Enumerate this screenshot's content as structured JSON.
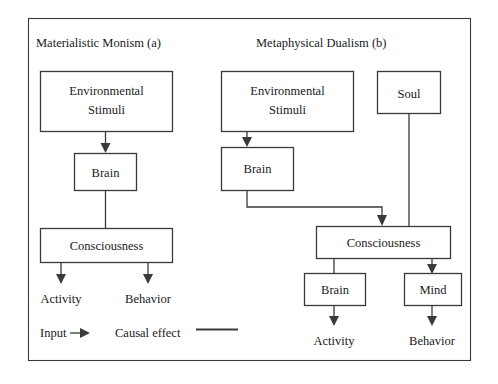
{
  "figure": {
    "panels": [
      {
        "id": "a",
        "title": "Materialistic Monism (a)",
        "nodes": [
          {
            "id": "a-env",
            "label": "Environmental\nStimuli",
            "line1": "Environmental",
            "line2": "Stimuli"
          },
          {
            "id": "a-brain",
            "label": "Brain"
          },
          {
            "id": "a-cons",
            "label": "Consciousness"
          }
        ],
        "outputs": [
          {
            "id": "a-activity",
            "label": "Activity"
          },
          {
            "id": "a-behavior",
            "label": "Behavior"
          }
        ],
        "edges": [
          {
            "from": "a-env",
            "to": "a-brain",
            "kind": "input"
          },
          {
            "from": "a-brain",
            "to": "a-cons",
            "kind": "causal"
          },
          {
            "from": "a-cons",
            "to": "a-activity",
            "kind": "input"
          },
          {
            "from": "a-cons",
            "to": "a-behavior",
            "kind": "input"
          }
        ]
      },
      {
        "id": "b",
        "title": "Metaphysical Dualism (b)",
        "nodes": [
          {
            "id": "b-env",
            "label": "Environmental\nStimuli",
            "line1": "Environmental",
            "line2": "Stimuli"
          },
          {
            "id": "b-soul",
            "label": "Soul"
          },
          {
            "id": "b-brain",
            "label": "Brain"
          },
          {
            "id": "b-cons",
            "label": "Consciousness"
          },
          {
            "id": "b-brain2",
            "label": "Brain"
          },
          {
            "id": "b-mind",
            "label": "Mind"
          }
        ],
        "outputs": [
          {
            "id": "b-activity",
            "label": "Activity"
          },
          {
            "id": "b-behavior",
            "label": "Behavior"
          }
        ],
        "edges": [
          {
            "from": "b-env",
            "to": "b-brain",
            "kind": "input"
          },
          {
            "from": "b-brain",
            "to": "b-cons",
            "kind": "input"
          },
          {
            "from": "b-soul",
            "to": "b-cons",
            "kind": "causal"
          },
          {
            "from": "b-cons",
            "to": "b-brain2",
            "kind": "causal"
          },
          {
            "from": "b-cons",
            "to": "b-mind",
            "kind": "input"
          },
          {
            "from": "b-brain2",
            "to": "b-activity",
            "kind": "input"
          },
          {
            "from": "b-mind",
            "to": "b-behavior",
            "kind": "input"
          }
        ]
      }
    ],
    "legend": {
      "input_label": "Input",
      "causal_label": "Causal effect"
    },
    "colors": {
      "stroke": "#3a3a3a",
      "text": "#1a1a1a",
      "background": "#ffffff"
    }
  }
}
